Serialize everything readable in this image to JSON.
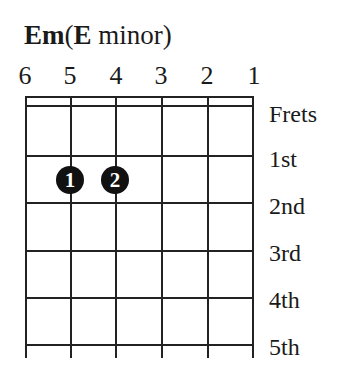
{
  "chord": {
    "symbol": "Em",
    "open_paren": "(",
    "root": "E",
    "quality": " minor",
    "close_paren": ")"
  },
  "strings": [
    "6",
    "5",
    "4",
    "3",
    "2",
    "1"
  ],
  "frets_header": "Frets",
  "fret_labels": [
    "1st",
    "2nd",
    "3rd",
    "4th",
    "5th"
  ],
  "fingers": [
    {
      "finger": "1",
      "string": "5",
      "fret": "2nd"
    },
    {
      "finger": "2",
      "string": "4",
      "fret": "2nd"
    }
  ],
  "colors": {
    "ink": "#1a1a1a",
    "dot": "#111111",
    "dot_text": "#ffffff",
    "background": "#ffffff"
  }
}
